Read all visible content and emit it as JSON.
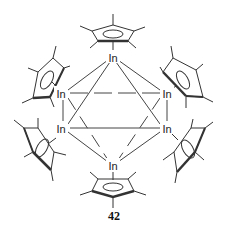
{
  "diagram": {
    "type": "chemical-structure",
    "atoms": [
      {
        "id": "in-top",
        "label": "In",
        "x": 113,
        "y": 58
      },
      {
        "id": "in-upper-left",
        "label": "In",
        "x": 61,
        "y": 94
      },
      {
        "id": "in-upper-right",
        "label": "In",
        "x": 167,
        "y": 94
      },
      {
        "id": "in-lower-left",
        "label": "In",
        "x": 61,
        "y": 129
      },
      {
        "id": "in-lower-right",
        "label": "In",
        "x": 167,
        "y": 129
      },
      {
        "id": "in-bottom",
        "label": "In",
        "x": 113,
        "y": 166
      }
    ],
    "ligands": [
      "Cp*",
      "Cp*",
      "Cp*",
      "Cp*",
      "Cp*",
      "Cp*"
    ],
    "compound_number": "42"
  }
}
